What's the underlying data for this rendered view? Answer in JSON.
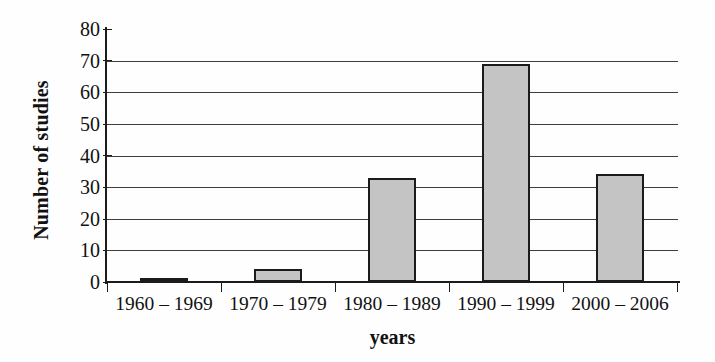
{
  "chart_data": {
    "type": "bar",
    "title": "",
    "subtitle": "",
    "xlabel": "years",
    "ylabel": "Number of studies",
    "categories": [
      "1960 – 1969",
      "1970 – 1979",
      "1980 – 1989",
      "1990 – 1999",
      "2000 – 2006"
    ],
    "values": [
      1,
      4,
      33,
      69,
      34
    ],
    "series": [
      {
        "name": "Number of studies",
        "values": [
          1,
          4,
          33,
          69,
          34
        ]
      }
    ],
    "ylim": [
      0,
      80
    ],
    "y_ticks": [
      0,
      10,
      20,
      30,
      40,
      50,
      60,
      70,
      80
    ],
    "y_tick_labels": [
      "0",
      "10",
      "20",
      "30",
      "40",
      "50",
      "60",
      "70",
      "80"
    ],
    "grid": "horizontal",
    "gridlines_at": [
      10,
      20,
      30,
      40,
      50,
      60,
      70
    ],
    "legend": "none",
    "bar_fill_color": "#c4c4c4",
    "bar_border_color": "#1b1b1b",
    "gridline_color": "#3d3d3d",
    "axis_color": "#1b1b1b",
    "background_color": "#fefefe"
  }
}
